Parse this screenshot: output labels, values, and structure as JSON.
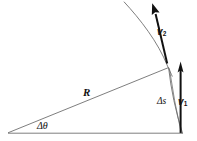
{
  "figure": {
    "type": "physics-vector-diagram",
    "width": 197,
    "height": 141,
    "background_color": "#ffffff",
    "line_color": "#6b6b6b",
    "vector_color": "#111111",
    "text_color": "#111111"
  },
  "labels": {
    "radius": "R",
    "angle": "Δθ",
    "arc_length": "Δs",
    "velocity_1_symbol": "v",
    "velocity_1_subscript": "1",
    "velocity_2_symbol": "v",
    "velocity_2_subscript": "2"
  },
  "geometry": {
    "center_vertex": [
      8,
      133
    ],
    "base_right_vertex": [
      183,
      133
    ],
    "arc_upper_point": [
      168,
      68
    ],
    "radius_line": {
      "from": [
        8,
        133
      ],
      "to": [
        168,
        68
      ]
    },
    "baseline": {
      "from": [
        8,
        133
      ],
      "to": [
        183,
        133
      ]
    },
    "delta_s_arc": {
      "from": [
        168,
        68
      ],
      "to": [
        183,
        133
      ]
    },
    "v1_vector": {
      "tail": [
        181,
        133
      ],
      "tip": [
        180,
        62
      ],
      "direction": "up"
    },
    "v2_vector": {
      "tail": [
        167,
        63
      ],
      "tip": [
        152,
        3
      ],
      "direction": "up-left"
    },
    "trajectory_curve": {
      "from": [
        124,
        2
      ],
      "to": [
        172,
        76
      ]
    }
  }
}
